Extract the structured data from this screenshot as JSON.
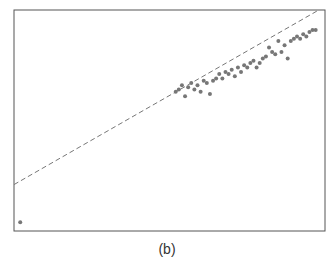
{
  "caption": "(b)",
  "chart_data": {
    "type": "scatter",
    "title": "",
    "xlabel": "",
    "ylabel": "",
    "grid": false,
    "axes_ticks_visible": false,
    "xlim": [
      0,
      100
    ],
    "ylim": [
      0,
      100
    ],
    "reference_line": {
      "style": "dashed",
      "x": [
        0,
        98
      ],
      "y": [
        21,
        100
      ]
    },
    "series": [
      {
        "name": "points",
        "x": [
          2,
          52,
          53,
          54,
          55,
          56,
          57,
          58,
          59,
          60,
          61,
          62,
          63,
          64,
          65,
          66,
          67,
          68,
          69,
          70,
          71,
          72,
          73,
          74,
          75,
          76,
          77,
          78,
          79,
          80,
          81,
          82,
          83,
          84,
          85,
          86,
          87,
          88,
          89,
          90,
          91,
          92,
          93,
          94,
          95,
          96,
          97
        ],
        "y": [
          4,
          63,
          64,
          66,
          61,
          65,
          67,
          64,
          66,
          63,
          68,
          67,
          62,
          68,
          69,
          71,
          69,
          72,
          71,
          73,
          70,
          74,
          72,
          75,
          74,
          76,
          77,
          74,
          76,
          78,
          79,
          83,
          81,
          80,
          86,
          81,
          84,
          78,
          86,
          87,
          88,
          87,
          89,
          88,
          90,
          91,
          91
        ]
      }
    ]
  }
}
